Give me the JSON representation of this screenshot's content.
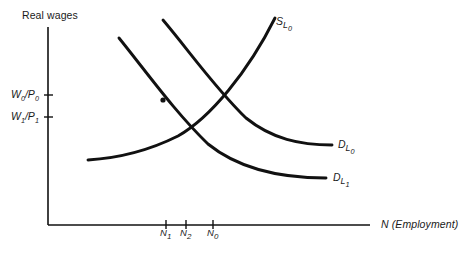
{
  "figure": {
    "type": "line-diagram",
    "background_color": "#ffffff",
    "ink_color": "#111111"
  },
  "axes": {
    "y_title": "Real wages",
    "x_title": "N (Employment)",
    "x_title_italic": true,
    "y_origin_px": 225,
    "x_origin_px": 48,
    "y_top_px": 27,
    "x_right_px": 370,
    "y_ticks": [
      {
        "id": "w0p0",
        "base": "W",
        "sub1": "0",
        "den": "P",
        "sub2": "0",
        "text": "W0/P0",
        "y_px": 95
      },
      {
        "id": "w1p1",
        "base": "W",
        "sub1": "1",
        "den": "P",
        "sub2": "1",
        "text": "W1/P1",
        "y_px": 117
      }
    ],
    "x_ticks": [
      {
        "id": "n1",
        "base": "N",
        "sub": "1",
        "text": "N1",
        "x_px": 166
      },
      {
        "id": "n2",
        "base": "N",
        "sub": "2",
        "text": "N2",
        "x_px": 186
      },
      {
        "id": "n0",
        "base": "N",
        "sub": "0",
        "text": "N0",
        "x_px": 213
      }
    ]
  },
  "curves": [
    {
      "id": "s_l0",
      "base": "S",
      "sub": "L",
      "subsub": "0",
      "text": "S_L0",
      "role": "labour-supply",
      "slope": "upward",
      "label_x_px": 276,
      "label_y_px": 16,
      "path": "M 88 160 C 120 158 150 150 178 136 C 210 118 248 72 275 18"
    },
    {
      "id": "d_l0",
      "base": "D",
      "sub": "L",
      "subsub": "0",
      "text": "D_L0",
      "role": "labour-demand-initial",
      "slope": "downward",
      "label_x_px": 338,
      "label_y_px": 139,
      "path": "M 163 20 C 190 52 215 88 246 118 C 272 139 300 145 332 145"
    },
    {
      "id": "d_l1",
      "base": "D",
      "sub": "L",
      "subsub": "1",
      "text": "D_L1",
      "role": "labour-demand-shifted",
      "slope": "downward",
      "label_x_px": 333,
      "label_y_px": 172,
      "path": "M 119 38 C 148 74 175 112 208 144 C 240 170 285 178 326 178"
    }
  ],
  "markers": [
    {
      "id": "dot-on-d-l1",
      "x_px": 163,
      "y_px": 100,
      "shape": "dot"
    }
  ],
  "intersections": [
    {
      "id": "equilibrium-0",
      "curves": [
        "s_l0",
        "d_l0"
      ],
      "x_px": 213,
      "y_px": 107
    },
    {
      "id": "equilibrium-1",
      "curves": [
        "s_l0",
        "d_l1"
      ],
      "x_px": 186,
      "y_px": 130
    }
  ]
}
